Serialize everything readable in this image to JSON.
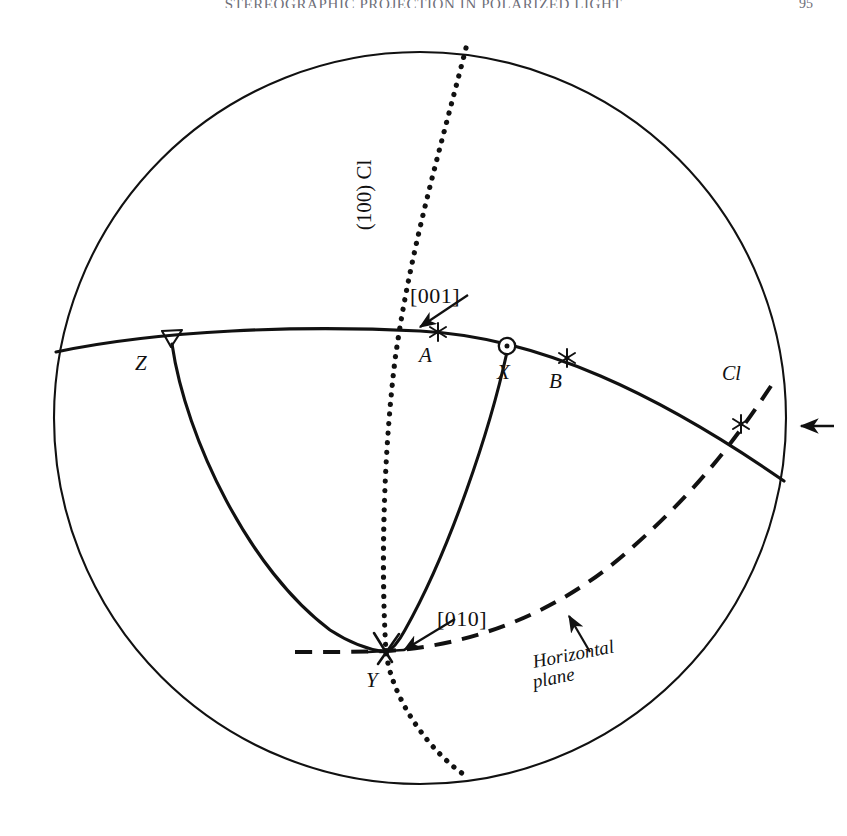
{
  "page": {
    "running_head": "STEREOGRAPHIC PROJECTION IN POLARIZED LIGHT",
    "folio": "95",
    "caption": ""
  },
  "figure": {
    "type": "stereographic-projection",
    "primitive_circle": {
      "cx": 420,
      "cy": 418,
      "r": 366
    },
    "labels": {
      "plane_100": "(100) Cl",
      "direction_001": "[001]",
      "direction_010": "[010]",
      "horizontal_plane_line1": "Horizontal",
      "horizontal_plane_line2": "plane",
      "cl": "Cl"
    },
    "points": [
      {
        "id": "Z",
        "label": "Z",
        "marker": "open-triangle",
        "x": 172,
        "y": 338,
        "label_x": 140,
        "label_y": 364
      },
      {
        "id": "A",
        "label": "A",
        "marker": "six-point-star",
        "x": 438,
        "y": 332,
        "label_x": 425,
        "label_y": 359
      },
      {
        "id": "X",
        "label": "X",
        "marker": "circle-dot",
        "x": 507,
        "y": 346,
        "label_x": 500,
        "label_y": 374
      },
      {
        "id": "B",
        "label": "B",
        "marker": "six-point-star",
        "x": 567,
        "y": 358,
        "label_x": 554,
        "label_y": 384
      },
      {
        "id": "Y",
        "label": "Y",
        "marker": "star-cluster",
        "x": 386,
        "y": 650,
        "label_x": 372,
        "label_y": 683
      },
      {
        "id": "Cl",
        "label": "Cl",
        "marker": "six-point-star",
        "x": 741,
        "y": 424,
        "label_x": 722,
        "label_y": 372
      }
    ],
    "curves": [
      {
        "id": "great-circle-XZ-primitive",
        "style": "solid"
      },
      {
        "id": "plane-100-trace",
        "style": "dotted"
      },
      {
        "id": "arc-Z-to-Y",
        "style": "solid"
      },
      {
        "id": "arc-X-to-Y",
        "style": "solid"
      },
      {
        "id": "horizontal-plane-trace",
        "style": "dashed"
      }
    ],
    "arrows": [
      {
        "id": "arrow-to-001",
        "from_x": 466,
        "from_y": 296,
        "to_x": 417,
        "to_y": 329
      },
      {
        "id": "arrow-to-010",
        "from_x": 453,
        "from_y": 620,
        "to_x": 401,
        "to_y": 652
      },
      {
        "id": "arrow-to-horizontal-plane",
        "from_x": 588,
        "from_y": 650,
        "to_x": 568,
        "to_y": 615
      },
      {
        "id": "edge-marker-arrow",
        "from_x": 830,
        "from_y": 426,
        "to_x": 800,
        "to_y": 426
      }
    ]
  }
}
